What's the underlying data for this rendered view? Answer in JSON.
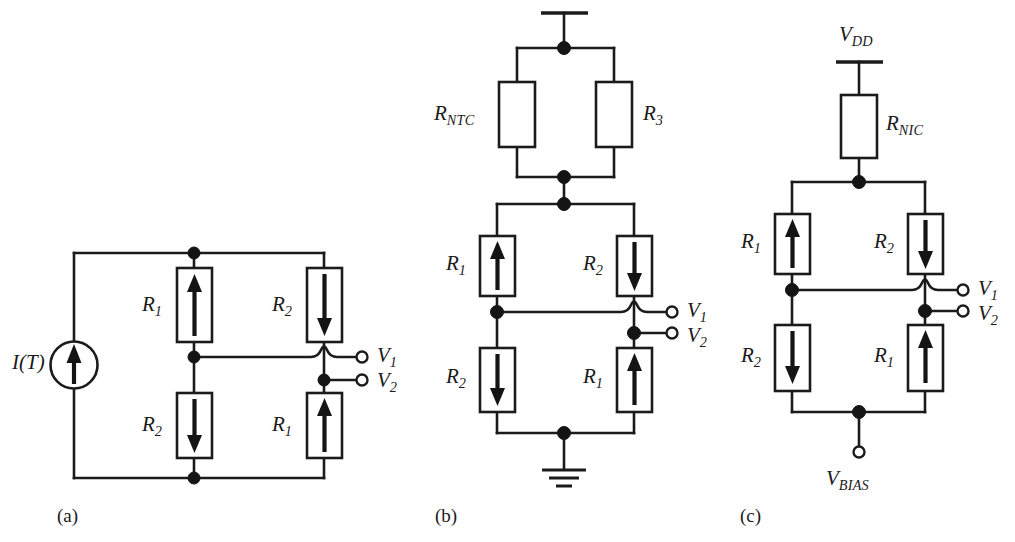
{
  "figure": {
    "type": "circuit-schematic-figure",
    "background_color": "#ffffff",
    "ink_color": "#1b1b1b",
    "width": 1015,
    "height": 542
  },
  "panels": [
    {
      "id": "a",
      "label": "(a)",
      "source": {
        "symbol": "current-source",
        "label_main": "I",
        "label_full": "I(T)",
        "arrow_direction": "up"
      },
      "resistors": [
        {
          "position": "top-left",
          "label_main": "R",
          "label_sub": "1",
          "arrow_direction": "up"
        },
        {
          "position": "top-right",
          "label_main": "R",
          "label_sub": "2",
          "arrow_direction": "down"
        },
        {
          "position": "bottom-left",
          "label_main": "R",
          "label_sub": "2",
          "arrow_direction": "down"
        },
        {
          "position": "bottom-right",
          "label_main": "R",
          "label_sub": "1",
          "arrow_direction": "up"
        }
      ],
      "outputs": [
        {
          "label_main": "V",
          "label_sub": "1"
        },
        {
          "label_main": "V",
          "label_sub": "2"
        }
      ]
    },
    {
      "id": "b",
      "label": "(b)",
      "top_rail": {
        "symbol": "supply-bar"
      },
      "bottom_rail": {
        "symbol": "ground"
      },
      "divider_resistors": [
        {
          "position": "left",
          "label_main": "R",
          "label_sub": "NTC",
          "arrow_direction": "none"
        },
        {
          "position": "right",
          "label_main": "R",
          "label_sub": "3",
          "arrow_direction": "none"
        }
      ],
      "resistors": [
        {
          "position": "top-left",
          "label_main": "R",
          "label_sub": "1",
          "arrow_direction": "up"
        },
        {
          "position": "top-right",
          "label_main": "R",
          "label_sub": "2",
          "arrow_direction": "down"
        },
        {
          "position": "bottom-left",
          "label_main": "R",
          "label_sub": "2",
          "arrow_direction": "down"
        },
        {
          "position": "bottom-right",
          "label_main": "R",
          "label_sub": "1",
          "arrow_direction": "up"
        }
      ],
      "outputs": [
        {
          "label_main": "V",
          "label_sub": "1"
        },
        {
          "label_main": "V",
          "label_sub": "2"
        }
      ]
    },
    {
      "id": "c",
      "label": "(c)",
      "supply": {
        "label_main": "V",
        "label_sub": "DD",
        "symbol": "supply-bar"
      },
      "series_resistor": {
        "label_main": "R",
        "label_sub": "NIC",
        "arrow_direction": "none"
      },
      "bias_terminal": {
        "label_main": "V",
        "label_sub": "BIAS",
        "symbol": "open-terminal"
      },
      "resistors": [
        {
          "position": "top-left",
          "label_main": "R",
          "label_sub": "1",
          "arrow_direction": "up"
        },
        {
          "position": "top-right",
          "label_main": "R",
          "label_sub": "2",
          "arrow_direction": "down"
        },
        {
          "position": "bottom-left",
          "label_main": "R",
          "label_sub": "2",
          "arrow_direction": "down"
        },
        {
          "position": "bottom-right",
          "label_main": "R",
          "label_sub": "1",
          "arrow_direction": "up"
        }
      ],
      "outputs": [
        {
          "label_main": "V",
          "label_sub": "1"
        },
        {
          "label_main": "V",
          "label_sub": "2"
        }
      ]
    }
  ]
}
